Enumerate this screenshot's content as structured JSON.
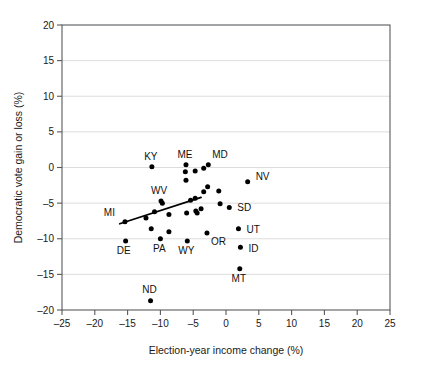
{
  "chart_data": {
    "type": "scatter",
    "title": "",
    "xlabel": "Election-year income change (%)",
    "ylabel": "Democratic vote gain or loss (%)",
    "xlim": [
      -25,
      25
    ],
    "ylim": [
      -20,
      20
    ],
    "xticks": [
      -25,
      -20,
      -15,
      -10,
      -5,
      0,
      5,
      10,
      15,
      20,
      25
    ],
    "xtick_labels": [
      "–25",
      "–20",
      "–15",
      "–10",
      "–5",
      "0",
      "5",
      "10",
      "15",
      "20",
      "25"
    ],
    "yticks": [
      -20,
      -15,
      -10,
      -5,
      0,
      5,
      10,
      15,
      20
    ],
    "ytick_labels": [
      "–20",
      "–15",
      "–10",
      "–5",
      "0",
      "5",
      "10",
      "15",
      "20"
    ],
    "grid": "horizontal",
    "legend": "none",
    "marker_color": "#000000",
    "grid_color": "#d9d9d9",
    "frame_color": "#58595b",
    "points": [
      {
        "label": "MI",
        "x": -15.4,
        "y": -7.6,
        "label_dx": -10,
        "label_dy": -6
      },
      {
        "label": "DE",
        "x": -15.3,
        "y": -10.3,
        "label_dx": -2,
        "label_dy": 13
      },
      {
        "label": "KY",
        "x": -11.3,
        "y": 0.1,
        "label_dx": -1,
        "label_dy": -7
      },
      {
        "label": "ND",
        "x": -11.5,
        "y": -18.7,
        "label_dx": -1,
        "label_dy": -8
      },
      {
        "label": "",
        "x": -11.4,
        "y": -8.6,
        "label_dx": 0,
        "label_dy": 0
      },
      {
        "label": "",
        "x": -10.9,
        "y": -6.2,
        "label_dx": 0,
        "label_dy": 0
      },
      {
        "label": "",
        "x": -12.2,
        "y": -7.1,
        "label_dx": 0,
        "label_dy": 0
      },
      {
        "label": "WV",
        "x": -9.9,
        "y": -4.7,
        "label_dx": -2,
        "label_dy": -7
      },
      {
        "label": "",
        "x": -9.7,
        "y": -5.0,
        "label_dx": 0,
        "label_dy": 0
      },
      {
        "label": "PA",
        "x": -10.0,
        "y": -10.0,
        "label_dx": -1,
        "label_dy": 13
      },
      {
        "label": "",
        "x": -8.7,
        "y": -9.0,
        "label_dx": 0,
        "label_dy": 0
      },
      {
        "label": "",
        "x": -8.7,
        "y": -6.6,
        "label_dx": 0,
        "label_dy": 0
      },
      {
        "label": "ME",
        "x": -6.1,
        "y": 0.4,
        "label_dx": -1,
        "label_dy": -7
      },
      {
        "label": "",
        "x": -6.2,
        "y": -0.6,
        "label_dx": 0,
        "label_dy": 0
      },
      {
        "label": "",
        "x": -6.1,
        "y": -1.8,
        "label_dx": 0,
        "label_dy": 0
      },
      {
        "label": "",
        "x": -6.0,
        "y": -6.4,
        "label_dx": 0,
        "label_dy": 0
      },
      {
        "label": "WY",
        "x": -5.9,
        "y": -10.3,
        "label_dx": -1,
        "label_dy": 13
      },
      {
        "label": "",
        "x": -5.4,
        "y": -4.6,
        "label_dx": 0,
        "label_dy": 0
      },
      {
        "label": "",
        "x": -4.7,
        "y": -4.3,
        "label_dx": 0,
        "label_dy": 0
      },
      {
        "label": "",
        "x": -4.7,
        "y": -0.5,
        "label_dx": 0,
        "label_dy": 0
      },
      {
        "label": "",
        "x": -4.6,
        "y": -6.1,
        "label_dx": 0,
        "label_dy": 0
      },
      {
        "label": "",
        "x": -4.4,
        "y": -6.4,
        "label_dx": 0,
        "label_dy": 0
      },
      {
        "label": "",
        "x": -3.8,
        "y": -5.8,
        "label_dx": 0,
        "label_dy": 0
      },
      {
        "label": "",
        "x": -3.4,
        "y": -0.1,
        "label_dx": 0,
        "label_dy": 0
      },
      {
        "label": "",
        "x": -3.4,
        "y": -3.4,
        "label_dx": 0,
        "label_dy": 0
      },
      {
        "label": "MD",
        "x": -2.7,
        "y": 0.4,
        "label_dx": 4,
        "label_dy": -7
      },
      {
        "label": "",
        "x": -2.8,
        "y": -2.7,
        "label_dx": 0,
        "label_dy": 0
      },
      {
        "label": "OR",
        "x": -2.9,
        "y": -9.2,
        "label_dx": 4,
        "label_dy": 12
      },
      {
        "label": "",
        "x": -1.1,
        "y": -3.3,
        "label_dx": 0,
        "label_dy": 0
      },
      {
        "label": "",
        "x": -0.9,
        "y": -5.1,
        "label_dx": 0,
        "label_dy": 0
      },
      {
        "label": "SD",
        "x": 0.5,
        "y": -5.6,
        "label_dx": 8,
        "label_dy": 4
      },
      {
        "label": "UT",
        "x": 1.9,
        "y": -8.6,
        "label_dx": 8,
        "label_dy": 4
      },
      {
        "label": "ID",
        "x": 2.2,
        "y": -11.2,
        "label_dx": 8,
        "label_dy": 5
      },
      {
        "label": "MT",
        "x": 2.1,
        "y": -14.2,
        "label_dx": -1,
        "label_dy": 13
      },
      {
        "label": "NV",
        "x": 3.3,
        "y": -2.0,
        "label_dx": 8,
        "label_dy": -2
      }
    ],
    "trendline": {
      "x_start": -16.2,
      "y_start": -7.9,
      "x_end": -3.8,
      "y_end": -4.2,
      "slope": 0.3,
      "note": "least-squares fit, positive slope"
    }
  }
}
